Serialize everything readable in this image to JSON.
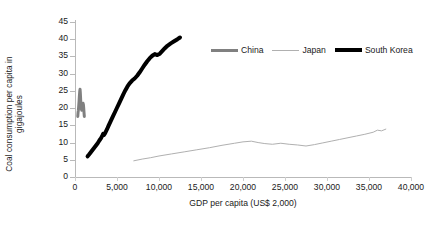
{
  "chart_data": {
    "type": "line",
    "title": "",
    "xlabel": "GDP per capita (US$ 2,000)",
    "ylabel": "Coal consumption per capita in gigajoules",
    "ylabel_line1": "Coal consumption per capita in",
    "ylabel_line2": "gigajoules",
    "xlim": [
      0,
      40000
    ],
    "ylim": [
      0,
      45
    ],
    "xticks": [
      0,
      5000,
      10000,
      15000,
      20000,
      25000,
      30000,
      35000,
      40000
    ],
    "xtick_labels": [
      "0",
      "5,000",
      "10,000",
      "15,000",
      "20,000",
      "25,000",
      "30,000",
      "35,000",
      "40,000"
    ],
    "yticks": [
      0,
      5,
      10,
      15,
      20,
      25,
      30,
      35,
      40,
      45
    ],
    "ytick_labels": [
      "0",
      "5",
      "10",
      "15",
      "20",
      "25",
      "30",
      "35",
      "40",
      "45"
    ],
    "grid": false,
    "legend_position": "top-right",
    "series": [
      {
        "name": "China",
        "color": "#808080",
        "width": 3.0,
        "points": [
          [
            330,
            17.6
          ],
          [
            360,
            18.6
          ],
          [
            400,
            19.4
          ],
          [
            430,
            20.2
          ],
          [
            455,
            21.0
          ],
          [
            480,
            21.8
          ],
          [
            500,
            22.6
          ],
          [
            520,
            23.4
          ],
          [
            545,
            24.2
          ],
          [
            570,
            25.0
          ],
          [
            600,
            25.5
          ],
          [
            630,
            24.6
          ],
          [
            655,
            23.4
          ],
          [
            680,
            22.2
          ],
          [
            700,
            21.2
          ],
          [
            730,
            20.4
          ],
          [
            760,
            19.8
          ],
          [
            800,
            19.4
          ],
          [
            840,
            19.6
          ],
          [
            880,
            20.2
          ],
          [
            920,
            20.8
          ],
          [
            960,
            21.4
          ],
          [
            1000,
            21.0
          ],
          [
            1030,
            20.2
          ],
          [
            1060,
            19.2
          ],
          [
            1090,
            18.2
          ],
          [
            1110,
            17.6
          ]
        ]
      },
      {
        "name": "Japan",
        "color": "#b0b0b0",
        "width": 1.0,
        "points": [
          [
            7000,
            4.7
          ],
          [
            8000,
            5.2
          ],
          [
            9000,
            5.6
          ],
          [
            10000,
            6.1
          ],
          [
            11500,
            6.7
          ],
          [
            13000,
            7.3
          ],
          [
            14500,
            7.9
          ],
          [
            16000,
            8.5
          ],
          [
            17500,
            9.2
          ],
          [
            19000,
            9.8
          ],
          [
            20000,
            10.2
          ],
          [
            21000,
            10.4
          ],
          [
            21800,
            10.0
          ],
          [
            22600,
            9.7
          ],
          [
            23500,
            9.5
          ],
          [
            24500,
            9.8
          ],
          [
            25500,
            9.5
          ],
          [
            26500,
            9.3
          ],
          [
            27500,
            9.0
          ],
          [
            28500,
            9.4
          ],
          [
            29500,
            9.9
          ],
          [
            30500,
            10.4
          ],
          [
            31500,
            10.9
          ],
          [
            32500,
            11.4
          ],
          [
            33500,
            11.9
          ],
          [
            34500,
            12.4
          ],
          [
            35500,
            13.0
          ],
          [
            36000,
            13.6
          ],
          [
            36500,
            13.4
          ],
          [
            37000,
            13.9
          ]
        ]
      },
      {
        "name": "South Korea",
        "color": "#000000",
        "width": 4.0,
        "points": [
          [
            1500,
            6.0
          ],
          [
            1700,
            6.6
          ],
          [
            1950,
            7.4
          ],
          [
            2200,
            8.2
          ],
          [
            2450,
            9.0
          ],
          [
            2700,
            9.8
          ],
          [
            2900,
            10.6
          ],
          [
            3100,
            11.3
          ],
          [
            3250,
            12.0
          ],
          [
            3350,
            12.5
          ],
          [
            3450,
            12.2
          ],
          [
            3600,
            12.8
          ],
          [
            3800,
            13.8
          ],
          [
            4000,
            14.9
          ],
          [
            4250,
            16.2
          ],
          [
            4500,
            17.5
          ],
          [
            4750,
            18.8
          ],
          [
            5000,
            20.1
          ],
          [
            5250,
            21.4
          ],
          [
            5500,
            22.7
          ],
          [
            5750,
            24.0
          ],
          [
            6000,
            25.2
          ],
          [
            6250,
            26.3
          ],
          [
            6500,
            27.2
          ],
          [
            6800,
            28.0
          ],
          [
            7100,
            28.6
          ],
          [
            7400,
            29.4
          ],
          [
            7700,
            30.4
          ],
          [
            8000,
            31.5
          ],
          [
            8300,
            32.6
          ],
          [
            8600,
            33.6
          ],
          [
            8900,
            34.5
          ],
          [
            9200,
            35.2
          ],
          [
            9500,
            35.7
          ],
          [
            9800,
            35.4
          ],
          [
            10100,
            35.8
          ],
          [
            10400,
            36.6
          ],
          [
            10700,
            37.4
          ],
          [
            11000,
            38.1
          ],
          [
            11400,
            38.8
          ],
          [
            11800,
            39.4
          ],
          [
            12200,
            40.0
          ],
          [
            12500,
            40.5
          ]
        ]
      }
    ]
  },
  "legend": {
    "items": [
      {
        "label": "China"
      },
      {
        "label": "Japan"
      },
      {
        "label": "South Korea"
      }
    ]
  }
}
